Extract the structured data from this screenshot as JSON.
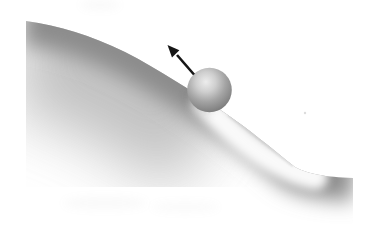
{
  "figure": {
    "elements": {
      "hill": "curved-hill-slope",
      "ball": "sphere-on-slope",
      "arrow": "up-slope-velocity-arrow",
      "trail": "ball-motion-trail"
    }
  },
  "colors": {
    "background": "#ffffff",
    "hill_shade_dark": "#8c8c8c",
    "hill_shade_mid": "#b2b2b2",
    "trail": "#ffffff",
    "edge_faint": "#c6c6c6",
    "ball_highlight": "#ededed",
    "ball_light": "#cfcfcf",
    "ball_mid": "#a4a4a4",
    "ball_shade": "#858585",
    "ball_dark": "#686868",
    "shadow": "#6e6e6e",
    "arrow": "#161616"
  }
}
